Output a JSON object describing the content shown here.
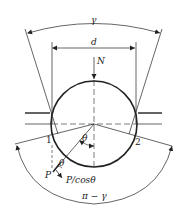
{
  "diagram": {
    "labels": {
      "gamma": "γ",
      "diameter": "d",
      "normal_force": "N",
      "theta_center": "θ",
      "point1": "1",
      "point2": "2",
      "force_p": "P",
      "theta_small": "θ",
      "p_over_cos": "P/cosθ",
      "pi_minus_gamma": "π − γ"
    },
    "colors": {
      "stroke": "#222222",
      "background": "#ffffff"
    }
  }
}
